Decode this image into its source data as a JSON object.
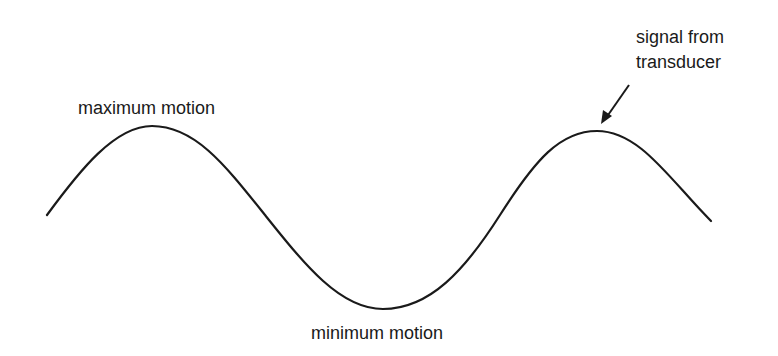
{
  "diagram": {
    "type": "waveform",
    "labels": {
      "maximum": "maximum motion",
      "minimum": "minimum motion",
      "signal_line1": "signal from",
      "signal_line2": "transducer"
    },
    "colors": {
      "stroke": "#1a1a1a",
      "background": "#ffffff"
    }
  }
}
